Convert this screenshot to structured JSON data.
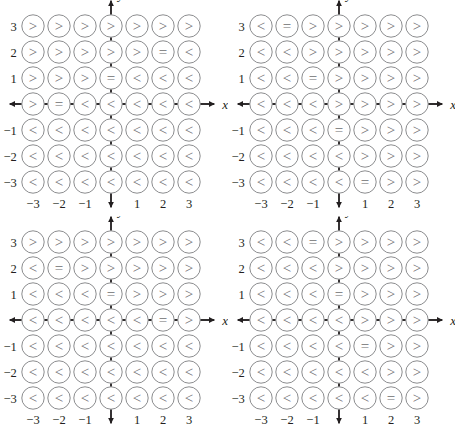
{
  "figure": {
    "title": "",
    "panel_count": 4,
    "symbols": {
      "less": "<",
      "equal": "=",
      "greater": ">"
    }
  },
  "axes": {
    "x_label": "x",
    "y_label": "y",
    "x_ticks": [
      "-3",
      "-2",
      "-1",
      "1",
      "2",
      "3"
    ],
    "y_ticks": [
      "3",
      "2",
      "1",
      "-1",
      "-2",
      "-3"
    ],
    "x_tick_values": [
      -3,
      -2,
      -1,
      1,
      2,
      3
    ],
    "y_tick_values": [
      3,
      2,
      1,
      -1,
      -2,
      -3
    ],
    "x_range": [
      -3,
      3
    ],
    "y_range": [
      -3,
      3
    ]
  },
  "colors": {
    "axis": "#231f20",
    "circle_stroke": "#8c8d8f",
    "symbol": "#6d6e70",
    "label": "#231f20",
    "background": "#ffffff"
  },
  "chart_data": {
    "type": "heatmap",
    "title": "",
    "xlabel": "x",
    "ylabel": "y",
    "x": [
      -3,
      -2,
      -1,
      0,
      1,
      2,
      3
    ],
    "y_top_to_bottom": [
      3,
      2,
      1,
      0,
      -1,
      -2,
      -3
    ],
    "grid": true,
    "legend": "none",
    "panels": [
      {
        "name": "panel-1",
        "position": "top-left",
        "rows": [
          {
            "y": 3,
            "values": [
              ">",
              ">",
              ">",
              ">",
              ">",
              ">",
              ">"
            ]
          },
          {
            "y": 2,
            "values": [
              ">",
              ">",
              ">",
              ">",
              ">",
              "=",
              "<"
            ]
          },
          {
            "y": 1,
            "values": [
              ">",
              ">",
              ">",
              "=",
              "<",
              "<",
              "<"
            ]
          },
          {
            "y": 0,
            "values": [
              ">",
              "=",
              "<",
              "<",
              "<",
              "<",
              "<"
            ]
          },
          {
            "y": -1,
            "values": [
              "<",
              "<",
              "<",
              "<",
              "<",
              "<",
              "<"
            ]
          },
          {
            "y": -2,
            "values": [
              "<",
              "<",
              "<",
              "<",
              "<",
              "<",
              "<"
            ]
          },
          {
            "y": -3,
            "values": [
              "<",
              "<",
              "<",
              "<",
              "<",
              "<",
              "<"
            ]
          }
        ]
      },
      {
        "name": "panel-2",
        "position": "top-right",
        "rows": [
          {
            "y": 3,
            "values": [
              "<",
              "=",
              ">",
              ">",
              ">",
              ">",
              ">"
            ]
          },
          {
            "y": 2,
            "values": [
              "<",
              "<",
              ">",
              ">",
              ">",
              ">",
              ">"
            ]
          },
          {
            "y": 1,
            "values": [
              "<",
              "<",
              "=",
              ">",
              ">",
              ">",
              ">"
            ]
          },
          {
            "y": 0,
            "values": [
              "<",
              "<",
              "<",
              ">",
              ">",
              ">",
              ">"
            ]
          },
          {
            "y": -1,
            "values": [
              "<",
              "<",
              "<",
              "=",
              ">",
              ">",
              ">"
            ]
          },
          {
            "y": -2,
            "values": [
              "<",
              "<",
              "<",
              "<",
              ">",
              ">",
              ">"
            ]
          },
          {
            "y": -3,
            "values": [
              "<",
              "<",
              "<",
              "<",
              "=",
              ">",
              ">"
            ]
          }
        ]
      },
      {
        "name": "panel-3",
        "position": "bottom-left",
        "rows": [
          {
            "y": 3,
            "values": [
              ">",
              ">",
              ">",
              ">",
              ">",
              ">",
              ">"
            ]
          },
          {
            "y": 2,
            "values": [
              "<",
              "=",
              ">",
              ">",
              ">",
              ">",
              ">"
            ]
          },
          {
            "y": 1,
            "values": [
              "<",
              "<",
              "<",
              "=",
              ">",
              ">",
              ">"
            ]
          },
          {
            "y": 0,
            "values": [
              "<",
              "<",
              "<",
              "<",
              "<",
              "=",
              ">"
            ]
          },
          {
            "y": -1,
            "values": [
              "<",
              "<",
              "<",
              "<",
              "<",
              "<",
              "<"
            ]
          },
          {
            "y": -2,
            "values": [
              "<",
              "<",
              "<",
              "<",
              "<",
              "<",
              "<"
            ]
          },
          {
            "y": -3,
            "values": [
              "<",
              "<",
              "<",
              "<",
              "<",
              "<",
              "<"
            ]
          }
        ]
      },
      {
        "name": "panel-4",
        "position": "bottom-right",
        "rows": [
          {
            "y": 3,
            "values": [
              "<",
              "<",
              "=",
              ">",
              ">",
              ">",
              ">"
            ]
          },
          {
            "y": 2,
            "values": [
              "<",
              "<",
              "<",
              ">",
              ">",
              ">",
              ">"
            ]
          },
          {
            "y": 1,
            "values": [
              "<",
              "<",
              "<",
              "=",
              ">",
              ">",
              ">"
            ]
          },
          {
            "y": 0,
            "values": [
              "<",
              "<",
              "<",
              "<",
              ">",
              ">",
              ">"
            ]
          },
          {
            "y": -1,
            "values": [
              "<",
              "<",
              "<",
              "<",
              "=",
              ">",
              ">"
            ]
          },
          {
            "y": -2,
            "values": [
              "<",
              "<",
              "<",
              "<",
              "<",
              ">",
              ">"
            ]
          },
          {
            "y": -3,
            "values": [
              "<",
              "<",
              "<",
              "<",
              "<",
              "=",
              ">"
            ]
          }
        ]
      }
    ]
  }
}
